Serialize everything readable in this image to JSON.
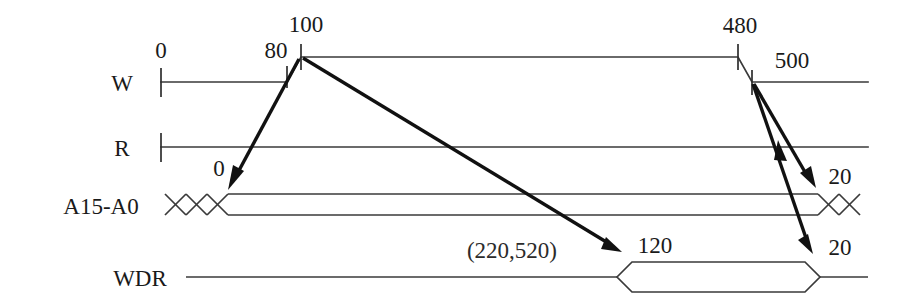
{
  "diagram": {
    "background_color": "#ffffff",
    "line_color": "#3a3a3a",
    "arrow_color": "#111111",
    "signals": [
      {
        "id": "W",
        "label": "W"
      },
      {
        "id": "R",
        "label": "R"
      },
      {
        "id": "A15-A0",
        "label": "A15-A0"
      },
      {
        "id": "WDR",
        "label": "WDR"
      }
    ],
    "time_labels": [
      {
        "id": "t0",
        "text": "0"
      },
      {
        "id": "t80",
        "text": "80"
      },
      {
        "id": "t100",
        "text": "100"
      },
      {
        "id": "t480",
        "text": "480"
      },
      {
        "id": "t500",
        "text": "500"
      }
    ],
    "annotations": [
      {
        "id": "addr-delay",
        "text": "0"
      },
      {
        "id": "data-delay",
        "text": "120"
      },
      {
        "id": "range",
        "text": "(220,520)"
      },
      {
        "id": "hold-addr",
        "text": "20"
      },
      {
        "id": "hold-data",
        "text": "20"
      }
    ]
  }
}
